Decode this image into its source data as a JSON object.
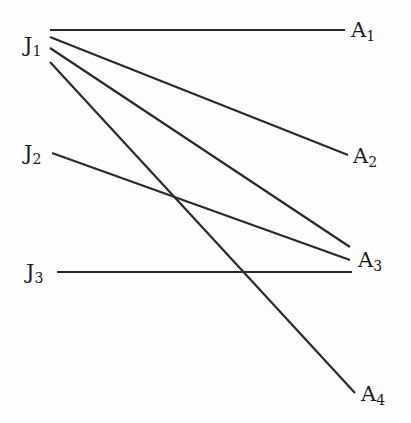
{
  "diagram": {
    "type": "bipartite-graph",
    "left_nodes": [
      {
        "id": "J1",
        "base": "J",
        "sub": "1",
        "x": 24,
        "y": 35
      },
      {
        "id": "J2",
        "base": "J",
        "sub": "2",
        "x": 24,
        "y": 143
      },
      {
        "id": "J3",
        "base": "J",
        "sub": "3",
        "x": 26,
        "y": 262
      }
    ],
    "right_nodes": [
      {
        "id": "A1",
        "base": "A",
        "sub": "1",
        "x": 351,
        "y": 20
      },
      {
        "id": "A2",
        "base": "A",
        "sub": "2",
        "x": 353,
        "y": 146
      },
      {
        "id": "A3",
        "base": "A",
        "sub": "3",
        "x": 358,
        "y": 250
      },
      {
        "id": "A4",
        "base": "A",
        "sub": "4",
        "x": 361,
        "y": 384
      }
    ],
    "edges": [
      {
        "from": "J1",
        "to": "A1",
        "x1": 50,
        "y1": 30,
        "x2": 345,
        "y2": 30
      },
      {
        "from": "J1",
        "to": "A2",
        "x1": 50,
        "y1": 37,
        "x2": 348,
        "y2": 155
      },
      {
        "from": "J1",
        "to": "A3",
        "x1": 50,
        "y1": 48,
        "x2": 350,
        "y2": 247
      },
      {
        "from": "J1",
        "to": "A4",
        "x1": 50,
        "y1": 62,
        "x2": 355,
        "y2": 393
      },
      {
        "from": "J2",
        "to": "A3",
        "x1": 52,
        "y1": 153,
        "x2": 350,
        "y2": 260
      },
      {
        "from": "J3",
        "to": "A3",
        "x1": 57,
        "y1": 272,
        "x2": 352,
        "y2": 272
      }
    ],
    "line_color": "#2a2a2a"
  }
}
